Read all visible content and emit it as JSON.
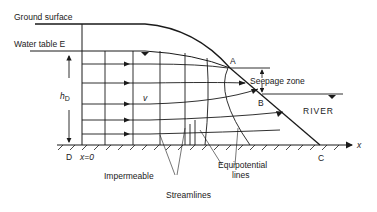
{
  "diagram": {
    "type": "groundwater seepage flow net to river",
    "labels": {
      "ground_surface": "Ground surface",
      "water_table": "Water table E",
      "head": "h",
      "head_sub": "D",
      "velocity": "v",
      "point_a": "A",
      "point_b": "B",
      "point_c": "C",
      "point_d": "D",
      "origin": "x=0",
      "seepage_zone": "Seepage zone",
      "river": "RIVER",
      "x_axis": "x",
      "impermeable": "Impermeable",
      "streamlines": "Streamlines",
      "equipotential_line1": "Equipotential",
      "equipotential_line2": "lines"
    },
    "colors": {
      "ink": "#1a1a1a",
      "background": "#ffffff"
    }
  }
}
